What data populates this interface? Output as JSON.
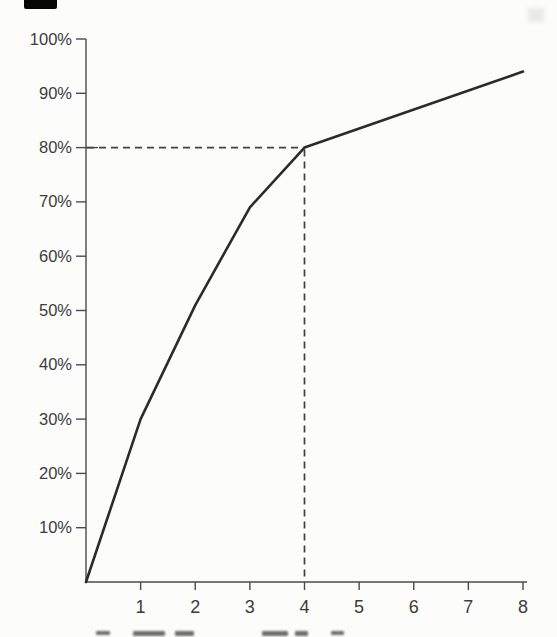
{
  "page": {
    "background": "#fcfcfb",
    "scan_artifact": {
      "present": true,
      "color": "#070707"
    }
  },
  "caption": {
    "cropped": true,
    "fragment": "The …"
  },
  "chart_data": {
    "type": "line",
    "title": "",
    "subtitle": "",
    "xlabel": "",
    "ylabel": "",
    "xlim": [
      0,
      8
    ],
    "ylim": [
      0,
      100
    ],
    "grid": false,
    "legend": "none",
    "x_ticks": [
      1,
      2,
      3,
      4,
      5,
      6,
      7,
      8
    ],
    "y_tick_values": [
      10,
      20,
      30,
      40,
      50,
      60,
      70,
      80,
      90,
      100
    ],
    "y_tick_labels": [
      "10%",
      "20%",
      "30%",
      "40%",
      "50%",
      "60%",
      "70%",
      "80%",
      "90%",
      "100%"
    ],
    "series": [
      {
        "name": "cumulative-percentage-curve",
        "points": [
          [
            0,
            0
          ],
          [
            1,
            30
          ],
          [
            2,
            51
          ],
          [
            3,
            69
          ],
          [
            4,
            80
          ],
          [
            8,
            94
          ]
        ]
      }
    ],
    "reference_lines": {
      "style": "dashed",
      "horizontal_at_percent": 80,
      "vertical_at_x": 4,
      "intersection_point": [
        4,
        80
      ]
    },
    "colors": {
      "line": "#2b2b2b",
      "axis": "#4a4a4a",
      "tick_label": "#3c3c3c",
      "dashed": "#404040"
    }
  }
}
